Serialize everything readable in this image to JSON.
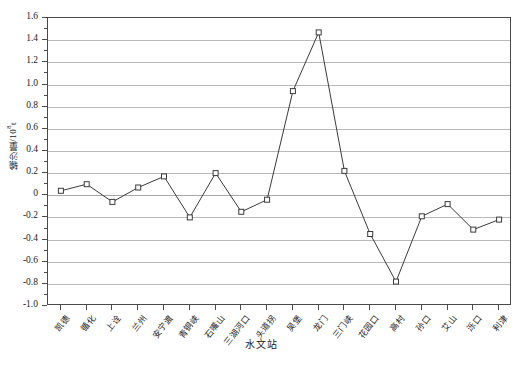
{
  "chart_data": {
    "type": "line",
    "title": "",
    "xlabel": "水文站",
    "ylabel": "输沙量/10",
    "ylabel_exponent": "8",
    "ylabel_unit": "t",
    "categories": [
      "凯德",
      "循化",
      "上诠",
      "兰州",
      "安宁渡",
      "青铜峡",
      "石嘴山",
      "三湖河口",
      "头道拐",
      "吴堡",
      "龙门",
      "三门峡",
      "花园口",
      "高村",
      "孙口",
      "艾山",
      "泺口",
      "利津"
    ],
    "values": [
      0.04,
      0.1,
      -0.06,
      0.07,
      0.17,
      -0.2,
      0.2,
      -0.15,
      -0.04,
      0.94,
      1.47,
      0.22,
      -0.35,
      -0.78,
      -0.19,
      -0.08,
      -0.31,
      -0.22
    ],
    "ylim": [
      -1.0,
      1.6
    ],
    "ytick_step": 0.2,
    "yticks": [
      "1.6",
      "1.4",
      "1.2",
      "1.0",
      "0.8",
      "0.6",
      "0.4",
      "0.2",
      "0",
      "-0.2",
      "-0.4",
      "-0.6",
      "-0.8",
      "-1.0"
    ],
    "ytick_values": [
      1.6,
      1.4,
      1.2,
      1.0,
      0.8,
      0.6,
      0.4,
      0.2,
      0,
      -0.2,
      -0.4,
      -0.6,
      -0.8,
      -1.0
    ],
    "grid": true,
    "legend": "none",
    "marker": "open-square",
    "line_color": "#3b3b3b",
    "grid_color": "#b9b9b9",
    "axis_color": "#4a4a4a",
    "background": "#ffffff"
  }
}
